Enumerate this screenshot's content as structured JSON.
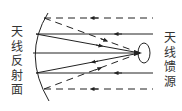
{
  "labels": {
    "reflector": [
      "天",
      "线",
      "反",
      "射",
      "面"
    ],
    "feed": [
      "天",
      "线",
      "馈",
      "源"
    ]
  },
  "colors": {
    "line": "#222222",
    "text": "#333333",
    "background": "#ffffff"
  },
  "rays": {
    "dashed_outer": "incoming parallel waves reflected toward feed (dashed)",
    "solid_inner": "incoming parallel waves reflected toward feed (solid)"
  }
}
